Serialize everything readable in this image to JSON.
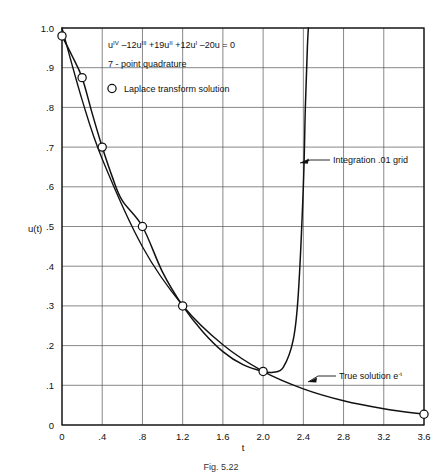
{
  "chart_data": {
    "type": "line",
    "title": "",
    "xlabel": "t",
    "ylabel": "u(t)",
    "xlim": [
      0,
      3.6
    ],
    "ylim": [
      0,
      1.0
    ],
    "grid": true,
    "xticks": [
      "0",
      ".4",
      ".8",
      "1.2",
      "1.6",
      "2.0",
      "2.4",
      "2.8",
      "3.2",
      "3.6"
    ],
    "xtick_values": [
      0,
      0.4,
      0.8,
      1.2,
      1.6,
      2.0,
      2.4,
      2.8,
      3.2,
      3.6
    ],
    "yticks": [
      "0",
      ".1",
      ".2",
      ".3",
      ".4",
      ".5",
      ".6",
      ".7",
      ".8",
      ".9",
      "1.0"
    ],
    "ytick_values": [
      0,
      0.1,
      0.2,
      0.3,
      0.4,
      0.5,
      0.6,
      0.7,
      0.8,
      0.9,
      1.0
    ],
    "legend_position": "inside-top-left",
    "series": [
      {
        "name": "Laplace transform solution",
        "marker": "open-circle",
        "x": [
          0.0,
          0.2,
          0.4,
          0.8,
          1.2,
          2.0,
          3.6
        ],
        "values": [
          0.98,
          0.875,
          0.7,
          0.5,
          0.3,
          0.135,
          0.027
        ]
      },
      {
        "name": "Integration .01 grid",
        "marker": "none",
        "x": [
          0.0,
          0.1,
          0.2,
          0.3,
          0.4,
          0.5,
          0.6,
          0.8,
          1.0,
          1.2,
          1.4,
          1.6,
          1.8,
          2.0,
          2.1,
          2.2,
          2.3,
          2.35,
          2.4,
          2.42,
          2.44,
          2.45
        ],
        "values": [
          0.98,
          0.93,
          0.875,
          0.785,
          0.7,
          0.625,
          0.565,
          0.5,
          0.385,
          0.3,
          0.235,
          0.185,
          0.152,
          0.135,
          0.133,
          0.145,
          0.215,
          0.33,
          0.6,
          0.8,
          0.95,
          1.0
        ]
      },
      {
        "name": "True solution e-t",
        "marker": "none",
        "x": [
          0.0,
          0.2,
          0.4,
          0.8,
          1.2,
          1.6,
          2.0,
          2.4,
          2.8,
          3.2,
          3.6
        ],
        "values": [
          1.0,
          0.819,
          0.67,
          0.449,
          0.301,
          0.202,
          0.135,
          0.091,
          0.061,
          0.041,
          0.027
        ]
      }
    ],
    "annotations": [
      {
        "id": "integration-label",
        "text": "Integration .01 grid",
        "points_to_x": 2.4,
        "points_to_y": 0.62
      },
      {
        "id": "true-solution-label",
        "text_parts": {
          "main": "True solution e",
          "sup": "-t"
        },
        "points_to_x": 2.62,
        "points_to_y": 0.105
      }
    ],
    "legend_entries": [
      {
        "marker": "open-circle",
        "label": "Laplace transform solution"
      }
    ],
    "textbox": {
      "equation_parts": [
        {
          "text": "u",
          "sup": false
        },
        {
          "text": "IV",
          "sup": true
        },
        {
          "text": " –12u",
          "sup": false
        },
        {
          "text": "III",
          "sup": true
        },
        {
          "text": " +19u",
          "sup": false
        },
        {
          "text": "II",
          "sup": true
        },
        {
          "text": " +12u",
          "sup": false
        },
        {
          "text": "I",
          "sup": true
        },
        {
          "text": " –20u = 0",
          "sup": false
        }
      ],
      "equation_plain": "uᴵᵛ –12uᴵᴵᴵ +19uᴵᴵ +12uᴵ –20u = 0",
      "method": "7 - point quadrature"
    },
    "caption": "Fig. 5.22"
  },
  "colors": {
    "curve": "#111111",
    "grid": "#555555",
    "frame": "#111111",
    "background": "#ffffff",
    "marker_fill": "#ffffff"
  }
}
